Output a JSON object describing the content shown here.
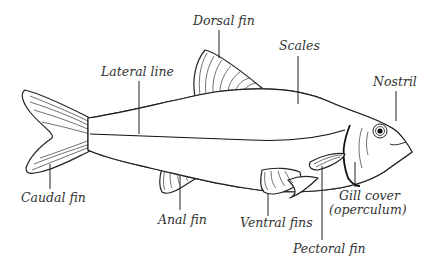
{
  "diagram": {
    "labels": [
      {
        "id": "dorsal-fin",
        "text": "Dorsal fin"
      },
      {
        "id": "scales",
        "text": "Scales"
      },
      {
        "id": "lateral-line",
        "text": "Lateral line"
      },
      {
        "id": "nostril",
        "text": "Nostril"
      },
      {
        "id": "caudal-fin",
        "text": "Caudal fin"
      },
      {
        "id": "anal-fin",
        "text": "Anal fin"
      },
      {
        "id": "ventral-fins",
        "text": "Ventral fins"
      },
      {
        "id": "gill-cover-line1",
        "text": "Gill cover"
      },
      {
        "id": "gill-cover-line2",
        "text": "(operculum)"
      },
      {
        "id": "pectoral-fin",
        "text": "Pectoral fin"
      }
    ],
    "colors": {
      "line": "#222222",
      "text": "#333333",
      "background": "#ffffff"
    }
  }
}
